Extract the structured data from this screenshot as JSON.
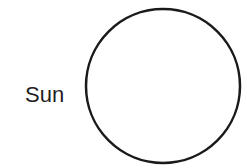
{
  "diagram": {
    "label": "Sun",
    "shape": {
      "type": "circle",
      "cx": 163,
      "cy": 86,
      "r": 77,
      "stroke": "#1a1a1a",
      "stroke_width": 2.5,
      "fill": "#ffffff"
    }
  }
}
